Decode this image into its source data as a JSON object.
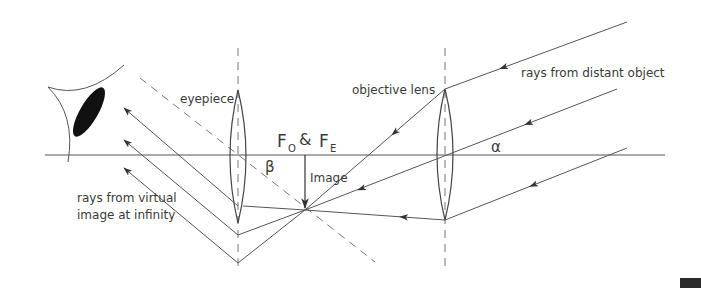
{
  "diagram": {
    "type": "refracting telescope ray diagram",
    "labels": {
      "eyepiece": "eyepiece",
      "objective_lens": "objective lens",
      "rays_distant": "rays from distant object",
      "rays_virtual_line1": "rays from virtual",
      "rays_virtual_line2": "image at infinity",
      "focus_f": "F",
      "focus_o_sub": "O",
      "focus_amp": "&",
      "focus_f2": "F",
      "focus_e_sub": "E",
      "image": "Image",
      "alpha": "α",
      "beta": "β"
    },
    "colors": {
      "line": "#555555",
      "eye_pupil": "#111111",
      "dashed": "#777777",
      "background": "#ffffff"
    }
  }
}
